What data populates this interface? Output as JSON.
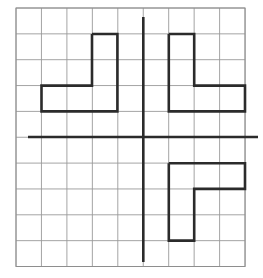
{
  "figure": {
    "title": "Polyomino shapes on a coordinate grid",
    "description": "A 9 by 10 square grid with light gray lines. A bold vertical axis line and a bold horizontal axis line cross near the center. Three dark outlined polyomino shapes are drawn: an L-shape in the upper left quadrant, an L-shape in the upper right quadrant, and an F/S-like shape in the lower right quadrant.",
    "background_color": "#ffffff"
  },
  "grid": {
    "columns": 9,
    "rows": 10,
    "origin_x": 16,
    "origin_y": 8,
    "cell_width": 25.45,
    "cell_height": 25.85,
    "line_color": "#9a9a9a",
    "line_width": 0.9,
    "border_color": "#8e8e8e",
    "border_width": 1.0
  },
  "axes": {
    "color": "#2b2b2b",
    "line_width": 2.6,
    "vertical": {
      "label": "vertical-axis",
      "x": 143.3,
      "y_start": 17,
      "y_end": 262
    },
    "horizontal": {
      "label": "horizontal-axis",
      "y": 137.0,
      "x_start": 28,
      "x_end": 258
    }
  },
  "shapes": {
    "stroke_color": "#2b2b2b",
    "stroke_width": 2.6,
    "fill": "none",
    "items": [
      {
        "name": "upper-left-L-shape",
        "quadrant": "upper-left",
        "points": "92,34 117.4,34 117.4,111.4 41.5,111.4 41.5,85.6 92,85.6 92,34"
      },
      {
        "name": "upper-right-L-shape",
        "quadrant": "upper-right",
        "points": "168.8,34 194.2,34 194.2,85.6 245,85.6 245,111.4 168.8,111.4 168.8,34"
      },
      {
        "name": "lower-right-F-shape",
        "quadrant": "lower-right",
        "points": "168.8,163.2 245,163.2 245,188.9 194.2,188.9 194.2,240.6 168.8,240.6 168.8,163.2"
      }
    ]
  }
}
